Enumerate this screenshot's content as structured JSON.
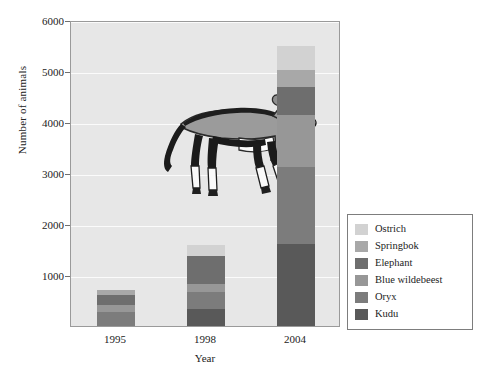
{
  "chart_data": {
    "type": "bar",
    "stacked": true,
    "title": "",
    "xlabel": "Year",
    "ylabel": "Number of animals",
    "categories": [
      "1995",
      "1998",
      "2004"
    ],
    "ylim": [
      0,
      6000
    ],
    "yticks": [
      1000,
      2000,
      3000,
      4000,
      5000,
      6000
    ],
    "ytick_labels": [
      "1000",
      "2000",
      "3000",
      "4000",
      "5000",
      "6000"
    ],
    "grid": true,
    "legend_position": "right",
    "series": [
      {
        "name": "Ostrich",
        "color": "#d2d2d2",
        "values": [
          0,
          220,
          470
        ]
      },
      {
        "name": "Springbok",
        "color": "#a8a8a8",
        "values": [
          100,
          0,
          330
        ]
      },
      {
        "name": "Elephant",
        "color": "#6e6e6e",
        "values": [
          200,
          550,
          550
        ]
      },
      {
        "name": "Blue wildebeest",
        "color": "#979797",
        "values": [
          135,
          155,
          1020
        ]
      },
      {
        "name": "Oryx",
        "color": "#7c7c7c",
        "values": [
          275,
          335,
          1510
        ]
      },
      {
        "name": "Kudu",
        "color": "#595959",
        "values": [
          0,
          330,
          1610
        ]
      }
    ],
    "totals": [
      710,
      1590,
      5490
    ]
  },
  "axes": {
    "y_title": "Number of animals",
    "x_title": "Year",
    "y_ticks": [
      "6000",
      "5000",
      "4000",
      "3000",
      "2000",
      "1000"
    ],
    "x_ticks": [
      "1995",
      "1998",
      "2004"
    ]
  },
  "legend": {
    "items": [
      {
        "label": "Ostrich",
        "color": "#d2d2d2"
      },
      {
        "label": "Springbok",
        "color": "#a8a8a8"
      },
      {
        "label": "Elephant",
        "color": "#6e6e6e"
      },
      {
        "label": "Blue wildebeest",
        "color": "#979797"
      },
      {
        "label": "Oryx",
        "color": "#7c7c7c"
      },
      {
        "label": "Kudu",
        "color": "#595959"
      }
    ]
  },
  "illustration": {
    "name": "oryx-antelope-drawing",
    "alt": "Drawing of an oryx antelope"
  },
  "caption": {
    "text": ""
  },
  "colors": {
    "plot_background": "#e7e7e7",
    "gridline": "#fbfbfb",
    "axis": "#9a9a9a",
    "page_background": "#ffffff"
  }
}
